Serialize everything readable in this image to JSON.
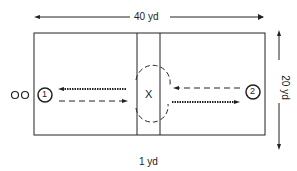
{
  "diagram": {
    "width_label": "40 yd",
    "height_label": "20 yd",
    "center_label": "1 yd",
    "center_marker": "X",
    "player1": "1",
    "player2": "2",
    "waiting_players": "OO",
    "colors": {
      "ink": "#222222",
      "background": "#ffffff"
    }
  }
}
